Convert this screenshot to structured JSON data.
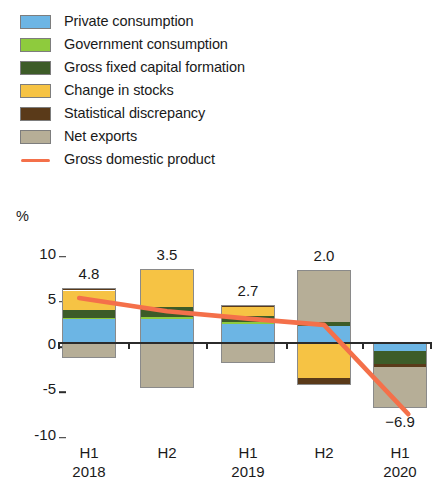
{
  "legend": {
    "items": [
      {
        "label": "Private consumption",
        "key": "private_consumption",
        "color": "#6cb5e4",
        "type": "swatch"
      },
      {
        "label": "Government consumption",
        "key": "government_consumption",
        "color": "#8ecb3d",
        "type": "swatch"
      },
      {
        "label": "Gross fixed capital formation",
        "key": "gross_fixed_capital",
        "color": "#3d5c28",
        "type": "swatch"
      },
      {
        "label": "Change in stocks",
        "key": "change_in_stocks",
        "color": "#f6c344",
        "type": "swatch"
      },
      {
        "label": "Statistical discrepancy",
        "key": "statistical_discrepancy",
        "color": "#5a3a19",
        "type": "swatch"
      },
      {
        "label": "Net exports",
        "key": "net_exports",
        "color": "#b6ae97",
        "type": "swatch"
      },
      {
        "label": "Gross domestic product",
        "key": "gross_domestic_product",
        "color": "#f4704a",
        "type": "line"
      }
    ]
  },
  "axis": {
    "unit": "%",
    "yticks": [
      "10",
      "5",
      "0",
      "-5",
      "-10"
    ],
    "ytick_values": [
      10,
      5,
      0,
      -5,
      -10
    ]
  },
  "chart_data": {
    "type": "bar",
    "subtype": "stacked-bar-with-line",
    "title": "",
    "xlabel": "",
    "ylabel": "%",
    "ylim": [
      -10,
      10
    ],
    "grid": false,
    "legend_position": "top-left",
    "categories": [
      "H1",
      "H2",
      "H1",
      "H2",
      "H1"
    ],
    "period_labels": [
      "2018",
      "",
      "2019",
      "",
      "2020"
    ],
    "x_tick_top": [
      "H1",
      "H2",
      "H1",
      "H2",
      "H1"
    ],
    "x_tick_bottom": [
      "2018",
      "",
      "2019",
      "",
      "2020"
    ],
    "series": [
      {
        "name": "Private consumption",
        "color": "#6cb5e4",
        "values": [
          2.6,
          2.6,
          2.1,
          1.9,
          -0.9
        ]
      },
      {
        "name": "Government consumption",
        "color": "#8ecb3d",
        "values": [
          0.2,
          0.3,
          0.2,
          0.0,
          0.0
        ]
      },
      {
        "name": "Gross fixed capital formation",
        "color": "#3d5c28",
        "values": [
          0.9,
          1.1,
          0.7,
          0.4,
          -1.4
        ]
      },
      {
        "name": "Change in stocks",
        "color": "#f6c344",
        "values": [
          2.1,
          4.2,
          1.0,
          -3.9,
          0.0
        ]
      },
      {
        "name": "Statistical discrepancy",
        "color": "#5a3a19",
        "values": [
          0.3,
          0.0,
          0.2,
          -0.7,
          -0.3
        ]
      },
      {
        "name": "Net exports",
        "color": "#b6ae97",
        "values": [
          -1.7,
          -5.0,
          -2.2,
          5.8,
          -4.6
        ]
      }
    ],
    "line_series": {
      "name": "Gross domestic product",
      "color": "#f4704a",
      "values": [
        4.8,
        3.5,
        2.7,
        2.0,
        -6.9
      ],
      "labels": [
        "4.8",
        "3.5",
        "2.7",
        "2.0",
        "−6.9"
      ]
    }
  },
  "bar_labels": [
    "4.8",
    "3.5",
    "2.7",
    "2.0",
    "−6.9"
  ]
}
